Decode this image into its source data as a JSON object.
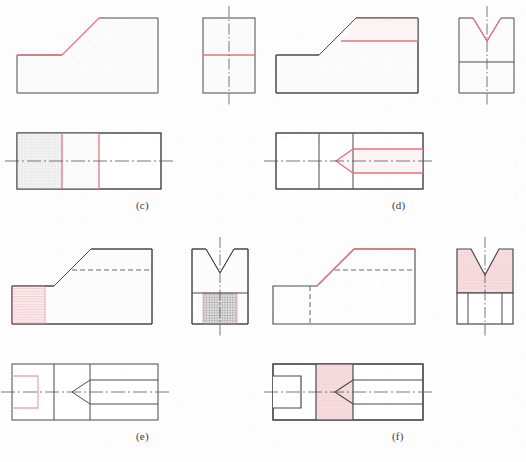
{
  "page": {
    "background_color": "#fdfdfd",
    "width": 526,
    "height": 462
  },
  "colors": {
    "outline": "#4a4a4a",
    "highlight_line": "#e8737f",
    "highlight_fill": "#f7dde0",
    "hatch_pink": "#eda8b0",
    "hatch_gray": "#9a9a9a",
    "gray_fill": "#c8c8c8",
    "faint_fill": "#f2f2f2",
    "centerline": "#555555",
    "hidden_line": "#5a5a5a",
    "label_text": "#3a3a3a"
  },
  "panels": [
    {
      "id": "c",
      "label": "(c)",
      "label_x": 140,
      "label_y": 205,
      "description": "Front view with inclined face, right side view, and top view; highlighted horizontal surface",
      "views": [
        {
          "name": "front-view",
          "type": "front",
          "highlight": "horizontal-top-surface-of-low-step",
          "highlight_color": "#e8737f"
        },
        {
          "name": "side-view",
          "type": "right-side",
          "highlight": "horizontal-edge-line",
          "highlight_color": "#e8737f"
        },
        {
          "name": "top-view",
          "type": "top",
          "highlight": "two-vertical-division-lines",
          "highlight_color": "#e8737f",
          "shaded_region": "left-third-light-gray"
        }
      ]
    },
    {
      "id": "d",
      "label": "(d)",
      "label_x": 392,
      "label_y": 205,
      "description": "Front view with inclined face, right side view with V-notch, and top view with arrow-shaped groove",
      "views": [
        {
          "name": "front-view",
          "type": "front",
          "highlight": "horizontal-line-below-top-face",
          "highlight_color": "#e8737f"
        },
        {
          "name": "side-view",
          "type": "right-side",
          "highlight": "v-notch-profile",
          "highlight_color": "#e8737f"
        },
        {
          "name": "top-view",
          "type": "top",
          "highlight": "v-groove-arrow-outline",
          "highlight_color": "#e8737f"
        }
      ]
    },
    {
      "id": "e",
      "label": "(e)",
      "label_x": 140,
      "label_y": 436,
      "description": "Front view with pink hatched left block, side view with gray hatched lower block, top view with pink slot outline",
      "views": [
        {
          "name": "front-view",
          "type": "front",
          "highlight": "left-end-block-hatched-pink",
          "highlight_color": "#eda8b0",
          "hidden_line": "horizontal-dashed-line"
        },
        {
          "name": "side-view",
          "type": "right-side",
          "highlight": "lower-center-block-hatched-gray",
          "highlight_color": "#9a9a9a"
        },
        {
          "name": "top-view",
          "type": "top",
          "highlight": "u-slot-outline-pink",
          "highlight_color": "#eda8b0"
        }
      ]
    },
    {
      "id": "f",
      "label": "(f)",
      "label_x": 392,
      "label_y": 436,
      "description": "Front view with inclined face, side view with pink filled V-notch upper block, top view with pink filled vertical band",
      "views": [
        {
          "name": "front-view",
          "type": "front",
          "highlight": "inclined-face-edge",
          "highlight_color": "#e8737f",
          "hidden_line": "horizontal-dashed-line"
        },
        {
          "name": "side-view",
          "type": "right-side",
          "highlight": "upper-v-notch-block-filled",
          "highlight_color": "#f7dde0"
        },
        {
          "name": "top-view",
          "type": "top",
          "highlight": "vertical-band-filled",
          "highlight_color": "#f7dde0"
        }
      ]
    }
  ]
}
